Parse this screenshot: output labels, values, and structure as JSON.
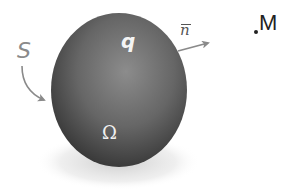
{
  "diagram": {
    "labels": {
      "surface": "S",
      "charge": "q",
      "volume": "Ω",
      "normal": "n",
      "point": "M"
    },
    "colors": {
      "body_dark": "#3a3a3a",
      "body_mid": "#6b6b6b",
      "body_highlight": "#8c8c8c",
      "arrow": "#8a8a8a",
      "shadow": "#d8d8d8",
      "inner_text": "#f4f4f4",
      "point_text": "#222222"
    }
  }
}
